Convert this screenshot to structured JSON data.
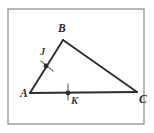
{
  "figure": {
    "kind": "geometry-diagram",
    "frame": {
      "stroke_color": "#9a9a9a",
      "fill_color": "#ffffff",
      "x": 8,
      "y": 9,
      "width": 136,
      "height": 115
    },
    "stroke_color": "#2e2e2e",
    "label_color": "#2b2b2b",
    "vertices": [
      {
        "name": "A",
        "label": "A",
        "x": 30,
        "y": 93,
        "label_x": 20,
        "label_y": 97
      },
      {
        "name": "B",
        "label": "B",
        "x": 63,
        "y": 40,
        "label_x": 58,
        "label_y": 32
      },
      {
        "name": "C",
        "label": "C",
        "x": 137,
        "y": 92,
        "label_x": 139,
        "label_y": 103
      }
    ],
    "segments": [
      {
        "name": "segment-AB",
        "from": "A",
        "to": "B"
      },
      {
        "name": "segment-BC",
        "from": "B",
        "to": "C"
      },
      {
        "name": "segment-AC",
        "from": "A",
        "to": "C"
      }
    ],
    "marked_points": [
      {
        "name": "J",
        "label": "J",
        "on_segment": "AB",
        "x": 46,
        "y": 66,
        "label_x": 40,
        "label_y": 55,
        "dot_radius": 2.4,
        "tick": {
          "x1": 41,
          "y1": 61,
          "x2": 53,
          "y2": 71
        }
      },
      {
        "name": "K",
        "label": "K",
        "on_segment": "AC",
        "x": 68,
        "y": 93,
        "label_x": 71,
        "label_y": 104,
        "dot_radius": 2.4,
        "tick": {
          "x1": 68,
          "y1": 84,
          "x2": 68,
          "y2": 100
        }
      }
    ]
  }
}
